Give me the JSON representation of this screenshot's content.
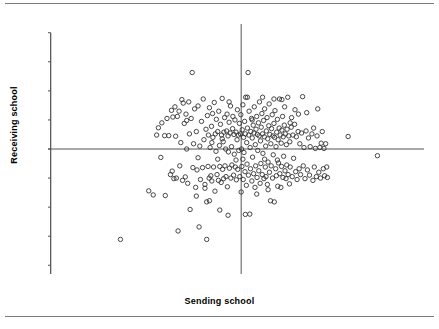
{
  "figure": {
    "background": "#ffffff",
    "rule_color": "#7a7a7a",
    "top_rule": "horizontal-rule",
    "bottom_rule": "horizontal-rule"
  },
  "chart_data": {
    "type": "scatter",
    "title": "",
    "xlabel": "Sending school",
    "ylabel": "Receiving school",
    "xlim": [
      -5.6,
      5.3
    ],
    "ylim": [
      -4.3,
      4.3
    ],
    "xticks": [
      -5,
      -4,
      -3,
      -2,
      -1,
      0,
      1,
      2,
      3,
      4,
      5
    ],
    "xticklabels": [
      "-5",
      "-4",
      "-3",
      "-2",
      "-1",
      "0",
      "1",
      "2",
      "3",
      "4",
      "5"
    ],
    "yticks": [
      -4,
      -3,
      -2,
      -1,
      0,
      1,
      2,
      3,
      4
    ],
    "yticklabels": [
      "-4",
      "-3",
      "-2",
      "-1",
      "0",
      "1",
      "2",
      "3",
      "4"
    ],
    "grid": false,
    "legend": null,
    "marker": {
      "style": "open-circle",
      "radius_px": 2.2,
      "stroke": "#333333",
      "fill": "none",
      "stroke_width": 0.9
    },
    "reference_lines": [
      {
        "orientation": "horizontal",
        "value": 0,
        "color": "#555555"
      },
      {
        "orientation": "vertical",
        "value": 0,
        "color": "#555555"
      }
    ],
    "n_points": 300,
    "points": [
      [
        -3.5,
        -3.11
      ],
      [
        -2.68,
        -1.44
      ],
      [
        -2.55,
        -1.58
      ],
      [
        -2.4,
        0.73
      ],
      [
        -2.33,
        -0.29
      ],
      [
        -2.3,
        0.9
      ],
      [
        -2.22,
        0.46
      ],
      [
        -2.2,
        -1.6
      ],
      [
        -2.1,
        0.46
      ],
      [
        -2.05,
        -0.88
      ],
      [
        -2.02,
        1.33
      ],
      [
        -2.0,
        -0.76
      ],
      [
        -1.98,
        1.1
      ],
      [
        -1.95,
        -1.02
      ],
      [
        -1.92,
        1.45
      ],
      [
        -1.9,
        0.44
      ],
      [
        -1.88,
        -1.0
      ],
      [
        -1.85,
        1.12
      ],
      [
        -1.83,
        -2.82
      ],
      [
        -1.8,
        1.3
      ],
      [
        -1.78,
        -0.58
      ],
      [
        -1.75,
        0.22
      ],
      [
        -1.72,
        1.7
      ],
      [
        -1.7,
        -1.08
      ],
      [
        -1.68,
        1.58
      ],
      [
        -1.65,
        0.88
      ],
      [
        -1.62,
        -0.96
      ],
      [
        -1.6,
        1.2
      ],
      [
        -1.58,
        0.0
      ],
      [
        -1.55,
        -1.18
      ],
      [
        -1.52,
        1.62
      ],
      [
        -1.5,
        0.52
      ],
      [
        -1.48,
        -2.08
      ],
      [
        -1.45,
        1.05
      ],
      [
        -1.42,
        2.63
      ],
      [
        -1.4,
        -0.64
      ],
      [
        -1.38,
        0.18
      ],
      [
        -1.35,
        1.38
      ],
      [
        -1.32,
        -1.32
      ],
      [
        -1.3,
        0.6
      ],
      [
        -1.28,
        -0.72
      ],
      [
        -1.25,
        1.48
      ],
      [
        -1.22,
        -2.68
      ],
      [
        -1.2,
        0.1
      ],
      [
        -1.18,
        -1.05
      ],
      [
        -1.15,
        0.95
      ],
      [
        -1.12,
        -0.64
      ],
      [
        -1.1,
        1.72
      ],
      [
        -1.08,
        0.32
      ],
      [
        -1.05,
        -1.22
      ],
      [
        -1.02,
        0.68
      ],
      [
        -1.0,
        -1.82
      ],
      [
        -0.98,
        1.15
      ],
      [
        -0.96,
        -0.6
      ],
      [
        -0.95,
        0.48
      ],
      [
        -0.93,
        -1.0
      ],
      [
        -0.92,
        1.42
      ],
      [
        -0.9,
        0.05
      ],
      [
        -0.88,
        -0.92
      ],
      [
        -0.86,
        0.78
      ],
      [
        -0.85,
        -1.1
      ],
      [
        -0.83,
        1.22
      ],
      [
        -0.82,
        0.4
      ],
      [
        -0.8,
        -0.62
      ],
      [
        -0.78,
        1.6
      ],
      [
        -0.76,
        -1.45
      ],
      [
        -0.75,
        0.52
      ],
      [
        -0.73,
        -0.08
      ],
      [
        -0.72,
        1.02
      ],
      [
        -0.7,
        -0.88
      ],
      [
        -0.68,
        0.6
      ],
      [
        -0.66,
        -1.08
      ],
      [
        -0.65,
        1.3
      ],
      [
        -0.63,
        0.12
      ],
      [
        -0.62,
        -0.6
      ],
      [
        -0.6,
        0.85
      ],
      [
        -0.58,
        -1.15
      ],
      [
        -0.57,
        0.48
      ],
      [
        -0.55,
        1.74
      ],
      [
        -0.54,
        -0.7
      ],
      [
        -0.52,
        0.25
      ],
      [
        -0.51,
        -1.02
      ],
      [
        -0.5,
        0.58
      ],
      [
        -0.48,
        1.08
      ],
      [
        -0.47,
        -0.58
      ],
      [
        -0.45,
        0.0
      ],
      [
        -0.44,
        -0.95
      ],
      [
        -0.42,
        0.62
      ],
      [
        -0.41,
        1.2
      ],
      [
        -0.4,
        -1.3
      ],
      [
        -0.38,
        0.45
      ],
      [
        -0.37,
        -0.1
      ],
      [
        -0.35,
        0.92
      ],
      [
        -0.34,
        -0.66
      ],
      [
        -0.32,
        0.55
      ],
      [
        -0.31,
        1.48
      ],
      [
        -0.3,
        -1.0
      ],
      [
        -0.28,
        0.08
      ],
      [
        -0.27,
        -0.55
      ],
      [
        -0.25,
        0.7
      ],
      [
        -0.24,
        1.12
      ],
      [
        -0.22,
        -0.9
      ],
      [
        -0.21,
        0.5
      ],
      [
        -0.2,
        -0.18
      ],
      [
        -0.18,
        1.0
      ],
      [
        -0.17,
        -0.62
      ],
      [
        -0.15,
        0.58
      ],
      [
        -0.14,
        -1.06
      ],
      [
        -0.12,
        0.32
      ],
      [
        -0.11,
        1.35
      ],
      [
        -0.1,
        -0.7
      ],
      [
        -0.08,
        0.48
      ],
      [
        -0.07,
        -0.05
      ],
      [
        -0.05,
        0.88
      ],
      [
        -0.04,
        -0.95
      ],
      [
        -0.02,
        0.52
      ],
      [
        -0.01,
        1.18
      ],
      [
        0.0,
        -1.48
      ],
      [
        0.01,
        0.0
      ],
      [
        0.02,
        -0.6
      ],
      [
        0.03,
        0.66
      ],
      [
        0.05,
        1.52
      ],
      [
        0.06,
        -1.05
      ],
      [
        0.07,
        0.4
      ],
      [
        0.08,
        -0.12
      ],
      [
        0.1,
        0.95
      ],
      [
        0.11,
        -0.78
      ],
      [
        0.12,
        0.52
      ],
      [
        0.13,
        1.78
      ],
      [
        0.15,
        -1.25
      ],
      [
        0.16,
        0.22
      ],
      [
        0.17,
        -0.52
      ],
      [
        0.18,
        0.72
      ],
      [
        0.2,
        2.63
      ],
      [
        0.21,
        -0.9
      ],
      [
        0.22,
        0.48
      ],
      [
        0.23,
        1.3
      ],
      [
        0.25,
        -2.24
      ],
      [
        0.26,
        0.05
      ],
      [
        0.27,
        -0.68
      ],
      [
        0.28,
        0.6
      ],
      [
        0.3,
        1.05
      ],
      [
        0.31,
        -1.1
      ],
      [
        0.32,
        0.38
      ],
      [
        0.33,
        -0.28
      ],
      [
        0.35,
        0.82
      ],
      [
        0.36,
        -0.85
      ],
      [
        0.37,
        0.55
      ],
      [
        0.38,
        1.45
      ],
      [
        0.4,
        -1.32
      ],
      [
        0.41,
        0.15
      ],
      [
        0.42,
        -0.58
      ],
      [
        0.43,
        0.68
      ],
      [
        0.45,
        1.12
      ],
      [
        0.46,
        -0.98
      ],
      [
        0.47,
        0.5
      ],
      [
        0.48,
        -0.05
      ],
      [
        0.5,
        0.9
      ],
      [
        0.51,
        -0.75
      ],
      [
        0.52,
        0.45
      ],
      [
        0.53,
        1.62
      ],
      [
        0.55,
        -1.18
      ],
      [
        0.56,
        0.28
      ],
      [
        0.57,
        -0.5
      ],
      [
        0.58,
        0.75
      ],
      [
        0.6,
        1.22
      ],
      [
        0.61,
        -0.88
      ],
      [
        0.62,
        0.52
      ],
      [
        0.63,
        -0.15
      ],
      [
        0.65,
        0.98
      ],
      [
        0.66,
        -1.02
      ],
      [
        0.67,
        0.42
      ],
      [
        0.68,
        1.38
      ],
      [
        0.7,
        -0.62
      ],
      [
        0.71,
        0.1
      ],
      [
        0.72,
        -0.95
      ],
      [
        0.73,
        0.62
      ],
      [
        0.75,
        1.08
      ],
      [
        0.76,
        -1.22
      ],
      [
        0.77,
        0.35
      ],
      [
        0.78,
        -0.45
      ],
      [
        0.8,
        0.8
      ],
      [
        0.81,
        1.55
      ],
      [
        0.82,
        -0.8
      ],
      [
        0.83,
        0.5
      ],
      [
        0.85,
        -1.78
      ],
      [
        0.86,
        0.18
      ],
      [
        0.87,
        -0.58
      ],
      [
        0.88,
        0.7
      ],
      [
        0.9,
        1.18
      ],
      [
        0.91,
        -1.0
      ],
      [
        0.92,
        0.45
      ],
      [
        0.93,
        -0.2
      ],
      [
        0.95,
        0.88
      ],
      [
        0.96,
        -1.82
      ],
      [
        0.97,
        0.4
      ],
      [
        0.98,
        1.32
      ],
      [
        1.0,
        -0.68
      ],
      [
        1.01,
        0.08
      ],
      [
        1.02,
        -0.92
      ],
      [
        1.03,
        0.58
      ],
      [
        1.05,
        1.02
      ],
      [
        1.06,
        -1.28
      ],
      [
        1.07,
        0.32
      ],
      [
        1.08,
        -0.48
      ],
      [
        1.1,
        0.72
      ],
      [
        1.11,
        1.72
      ],
      [
        1.12,
        -0.85
      ],
      [
        1.13,
        0.48
      ],
      [
        1.15,
        -1.32
      ],
      [
        1.16,
        0.2
      ],
      [
        1.17,
        -0.6
      ],
      [
        1.18,
        0.65
      ],
      [
        1.2,
        1.12
      ],
      [
        1.21,
        -0.98
      ],
      [
        1.22,
        0.42
      ],
      [
        1.23,
        -0.25
      ],
      [
        1.25,
        0.82
      ],
      [
        1.26,
        1.45
      ],
      [
        1.27,
        -0.75
      ],
      [
        1.28,
        0.52
      ],
      [
        1.3,
        -1.02
      ],
      [
        1.31,
        0.15
      ],
      [
        1.32,
        -0.55
      ],
      [
        1.33,
        0.68
      ],
      [
        1.35,
        1.78
      ],
      [
        1.36,
        -0.88
      ],
      [
        1.38,
        0.45
      ],
      [
        1.4,
        -1.2
      ],
      [
        1.41,
        0.25
      ],
      [
        1.42,
        -0.62
      ],
      [
        1.45,
        0.75
      ],
      [
        1.46,
        1.08
      ],
      [
        1.48,
        -0.95
      ],
      [
        1.5,
        0.48
      ],
      [
        1.52,
        -0.32
      ],
      [
        1.55,
        0.85
      ],
      [
        1.56,
        1.35
      ],
      [
        1.58,
        -0.78
      ],
      [
        1.6,
        0.42
      ],
      [
        1.62,
        -1.05
      ],
      [
        1.65,
        0.6
      ],
      [
        1.66,
        1.2
      ],
      [
        1.68,
        -0.68
      ],
      [
        1.7,
        0.18
      ],
      [
        1.72,
        -0.88
      ],
      [
        1.75,
        0.55
      ],
      [
        1.78,
        1.8
      ],
      [
        1.8,
        -0.58
      ],
      [
        1.82,
        0.05
      ],
      [
        1.85,
        -1.02
      ],
      [
        1.88,
        0.62
      ],
      [
        1.9,
        1.25
      ],
      [
        1.92,
        -0.72
      ],
      [
        1.95,
        0.38
      ],
      [
        1.98,
        -0.9
      ],
      [
        2.0,
        0.08
      ],
      [
        2.05,
        0.52
      ],
      [
        2.08,
        -1.08
      ],
      [
        2.1,
        0.72
      ],
      [
        2.12,
        -0.62
      ],
      [
        2.15,
        0.02
      ],
      [
        2.18,
        -0.95
      ],
      [
        2.2,
        0.45
      ],
      [
        2.22,
        1.38
      ],
      [
        2.25,
        -0.8
      ],
      [
        2.28,
        0.05
      ],
      [
        2.3,
        -1.0
      ],
      [
        2.32,
        0.2
      ],
      [
        2.35,
        0.6
      ],
      [
        2.38,
        -0.68
      ],
      [
        2.4,
        0.02
      ],
      [
        2.42,
        -0.92
      ],
      [
        2.45,
        0.18
      ],
      [
        2.48,
        -0.62
      ],
      [
        2.5,
        -0.98
      ],
      [
        3.1,
        0.43
      ],
      [
        3.95,
        -0.23
      ],
      [
        -2.45,
        0.48
      ],
      [
        -2.15,
        1.05
      ],
      [
        -1.3,
        -1.62
      ],
      [
        -1.05,
        -1.35
      ],
      [
        -0.92,
        -1.78
      ],
      [
        -0.68,
        -0.35
      ],
      [
        -0.55,
        0.35
      ],
      [
        -0.35,
        1.62
      ],
      [
        -0.15,
        -0.38
      ],
      [
        0.05,
        -0.35
      ],
      [
        0.18,
        1.78
      ],
      [
        0.45,
        -1.55
      ],
      [
        0.62,
        1.78
      ],
      [
        0.78,
        -1.4
      ],
      [
        0.95,
        1.72
      ],
      [
        1.18,
        1.7
      ],
      [
        1.42,
        0.9
      ],
      [
        -1.0,
        -3.11
      ],
      [
        -0.62,
        -2.1
      ],
      [
        -0.38,
        -2.28
      ],
      [
        0.12,
        -2.25
      ],
      [
        -1.58,
        0.98
      ],
      [
        -1.25,
        -0.3
      ],
      [
        -0.85,
        0.22
      ],
      [
        0.32,
        1.0
      ],
      [
        0.68,
        -0.35
      ],
      [
        1.05,
        -0.38
      ]
    ]
  }
}
